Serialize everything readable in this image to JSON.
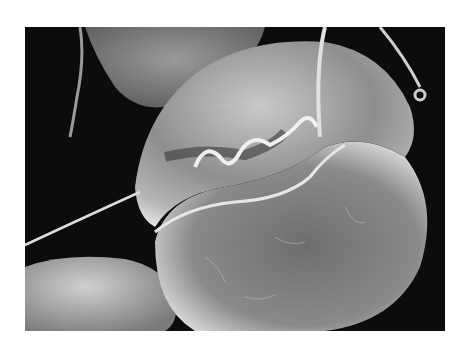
{
  "image": {
    "kind": "scanning electron micrograph",
    "subject": "single-celled organism with flagella (dinoflagellate-like cell)",
    "colors": {
      "background": "#0c0c0c",
      "page": "#ffffff",
      "cell_highlight": "#e8e8e8",
      "cell_mid": "#8a8a8a",
      "cell_shadow": "#3a3a3a"
    }
  }
}
